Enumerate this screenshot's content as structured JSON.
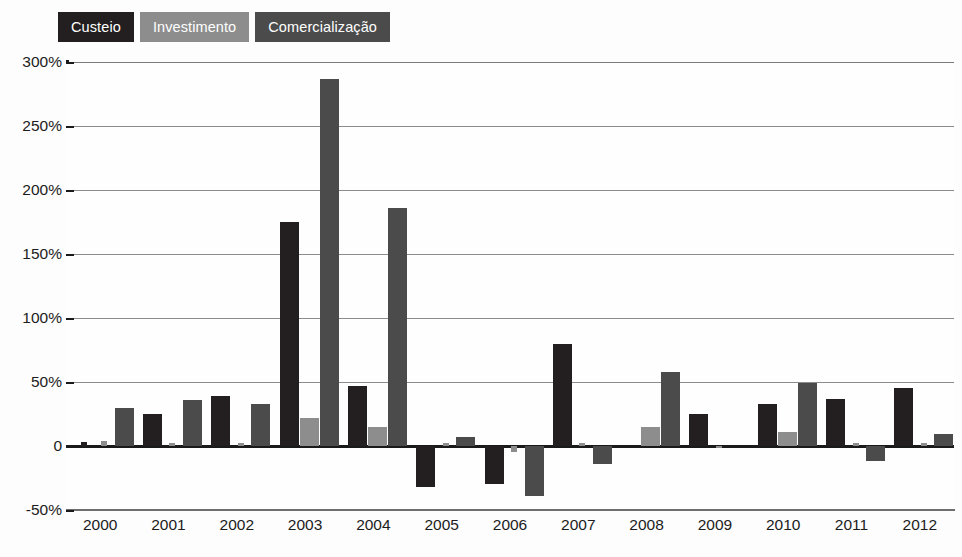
{
  "legend": {
    "items": [
      {
        "label": "Custeio",
        "color": "#231f20"
      },
      {
        "label": "Investimento",
        "color": "#8d8d8d"
      },
      {
        "label": "Comercialização",
        "color": "#4b4b4b"
      }
    ]
  },
  "chart_data": {
    "type": "bar",
    "title": "",
    "xlabel": "",
    "ylabel": "",
    "ylim": [
      -50,
      300
    ],
    "yticks": [
      300,
      250,
      200,
      150,
      100,
      50,
      0,
      -50
    ],
    "ytick_labels": [
      "300%",
      "250%",
      "200%",
      "150%",
      "100%",
      "50%",
      "0",
      "-50%"
    ],
    "grid": true,
    "legend_position": "top-left",
    "categories": [
      "2000",
      "2001",
      "2002",
      "2003",
      "2004",
      "2005",
      "2006",
      "2007",
      "2008",
      "2009",
      "2010",
      "2011",
      "2012"
    ],
    "series": [
      {
        "name": "Custeio",
        "color": "#231f20",
        "values": [
          3,
          25,
          39,
          175,
          47,
          -32,
          -30,
          80,
          0,
          25,
          33,
          37,
          45
        ]
      },
      {
        "name": "Investimento",
        "color": "#8d8d8d",
        "values": [
          4,
          2,
          2,
          22,
          15,
          2,
          -5,
          2,
          15,
          -1,
          11,
          2,
          2
        ]
      },
      {
        "name": "Comercialização",
        "color": "#4b4b4b",
        "values": [
          30,
          36,
          33,
          287,
          186,
          7,
          -39,
          -14,
          58,
          0,
          49,
          -12,
          9
        ]
      }
    ]
  }
}
